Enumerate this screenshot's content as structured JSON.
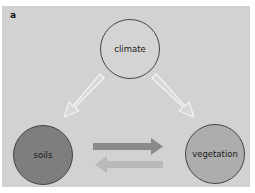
{
  "figure": {
    "panel_label": "a",
    "background_color": "#d2d2d2"
  },
  "nodes": [
    {
      "id": "climate",
      "label": "climate",
      "fill": "#d4d4d4",
      "stroke": "#444444"
    },
    {
      "id": "soils",
      "label": "soils",
      "fill": "#7e7e7e",
      "stroke": "#444444"
    },
    {
      "id": "vegetation",
      "label": "vegetation",
      "fill": "#adadad",
      "stroke": "#444444"
    }
  ],
  "edges": [
    {
      "from": "climate",
      "to": "soils",
      "style": "hollow-white-arrow"
    },
    {
      "from": "climate",
      "to": "vegetation",
      "style": "hollow-white-arrow"
    },
    {
      "from": "soils",
      "to": "vegetation",
      "style": "solid-arrow",
      "color": "#8a8a8a"
    },
    {
      "from": "vegetation",
      "to": "soils",
      "style": "solid-arrow",
      "color": "#b9b9b9"
    }
  ]
}
